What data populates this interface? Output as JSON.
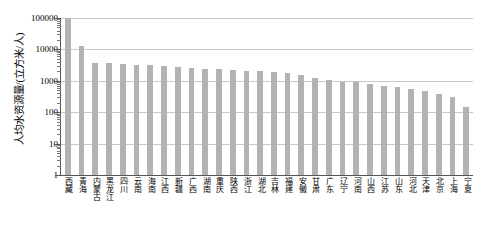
{
  "chart_data": {
    "type": "bar",
    "title": "",
    "xlabel": "",
    "ylabel": "人均水资源量/(立方米/人)",
    "yscale": "log",
    "ylim": [
      1,
      100000
    ],
    "grid": true,
    "legend": false,
    "bar_color": "#b3b3b3",
    "y_ticks": [
      {
        "value": 100000,
        "label": "100000"
      },
      {
        "value": 10000,
        "label": "10000"
      },
      {
        "value": 1000,
        "label": "1000"
      },
      {
        "value": 100,
        "label": "100"
      },
      {
        "value": 10,
        "label": "10"
      },
      {
        "value": 1,
        "label": "1"
      }
    ],
    "categories": [
      "西藏",
      "青海",
      "内蒙古",
      "黑龙江",
      "四川",
      "云南",
      "海南",
      "江西",
      "新疆",
      "广西",
      "湖南",
      "重庆",
      "陕西",
      "浙江",
      "湖北",
      "吉林",
      "福建",
      "安徽",
      "甘肃",
      "广东",
      "辽宁",
      "河南",
      "山西",
      "江苏",
      "山东",
      "河北",
      "天津",
      "北京",
      "上海",
      "宁夏"
    ],
    "values": [
      100000,
      13000,
      3700,
      3600,
      3500,
      3300,
      3150,
      3000,
      2800,
      2600,
      2450,
      2300,
      2200,
      2100,
      2000,
      1900,
      1800,
      1500,
      1200,
      1050,
      950,
      900,
      800,
      700,
      620,
      540,
      460,
      380,
      310,
      150
    ],
    "units": "立方米/人"
  }
}
